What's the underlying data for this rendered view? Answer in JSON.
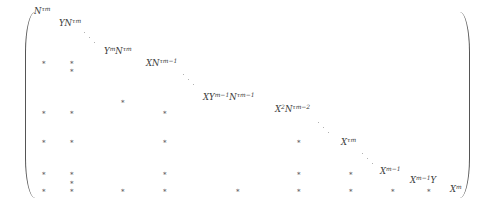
{
  "matrix": {
    "entries": [
      {
        "base": "N",
        "sup": "τm",
        "x": 34,
        "y": 6
      },
      {
        "base": "YN",
        "sup": "τm",
        "x": 59,
        "y": 18
      },
      {
        "base": "Y",
        "sup": "m",
        "base2": "N",
        "sup2": "τm",
        "x": 104,
        "y": 46
      },
      {
        "base": "XN",
        "sup": "τm−1",
        "x": 146,
        "y": 58
      },
      {
        "base": "XY",
        "sup": "m−1",
        "base2": "N",
        "sup2": "τm−1",
        "x": 203,
        "y": 92
      },
      {
        "base": "X",
        "sup": "2",
        "base2": "N",
        "sup2": "τm−2",
        "x": 275,
        "y": 104
      },
      {
        "base": "X",
        "sup": "τm",
        "x": 341,
        "y": 137
      },
      {
        "base": "X",
        "sup": "m−1",
        "x": 380,
        "y": 166
      },
      {
        "base": "X",
        "sup": "m−1",
        "base2": "Y",
        "sup2": "",
        "x": 410,
        "y": 175
      },
      {
        "base": "X",
        "sup": "m",
        "x": 450,
        "y": 184
      }
    ],
    "star_symbol": "*",
    "stars": [
      [
        42,
        61
      ],
      [
        70,
        61
      ],
      [
        70,
        69
      ],
      [
        121,
        100
      ],
      [
        42,
        111
      ],
      [
        70,
        111
      ],
      [
        163,
        111
      ],
      [
        42,
        140
      ],
      [
        70,
        140
      ],
      [
        163,
        140
      ],
      [
        297,
        140
      ],
      [
        42,
        172
      ],
      [
        70,
        172
      ],
      [
        163,
        172
      ],
      [
        297,
        172
      ],
      [
        349,
        172
      ],
      [
        70,
        181
      ],
      [
        42,
        189
      ],
      [
        70,
        189
      ],
      [
        121,
        189
      ],
      [
        163,
        189
      ],
      [
        236,
        189
      ],
      [
        297,
        189
      ],
      [
        349,
        189
      ],
      [
        391,
        189
      ],
      [
        427,
        189
      ]
    ],
    "diagonal_dots": [
      [
        84,
        32
      ],
      [
        183,
        74
      ],
      [
        318,
        122
      ],
      [
        362,
        153
      ]
    ]
  }
}
